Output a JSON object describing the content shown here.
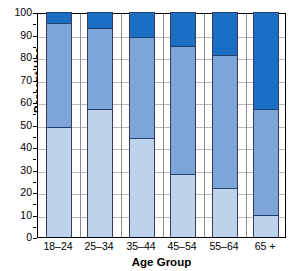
{
  "chart_data": {
    "type": "bar",
    "stacked": true,
    "title": "",
    "xlabel": "Age Group",
    "ylabel": "Percent Use",
    "categories": [
      "18–24",
      "25–34",
      "35–44",
      "45–54",
      "55–64",
      "65 +"
    ],
    "ylim": [
      0,
      100
    ],
    "ytick_labels": [
      "0",
      "10",
      "20",
      "30",
      "40",
      "50",
      "60",
      "70",
      "80",
      "90",
      "100"
    ],
    "ytick_values": [
      0,
      10,
      20,
      30,
      40,
      50,
      60,
      70,
      80,
      90,
      100
    ],
    "grid": true,
    "legend": "none",
    "series": [
      {
        "name": "light-blue-segment",
        "color": "#bdd3ec",
        "values": [
          49,
          57,
          44,
          28,
          22,
          10
        ]
      },
      {
        "name": "medium-blue-segment",
        "color": "#7ea5d8",
        "values": [
          46,
          36,
          45,
          57,
          59,
          47
        ]
      },
      {
        "name": "dark-blue-segment",
        "color": "#1a6fc4",
        "values": [
          5,
          7,
          11,
          15,
          19,
          43
        ]
      }
    ],
    "cumulative_tops": [
      [
        49,
        95,
        100
      ],
      [
        57,
        93,
        100
      ],
      [
        44,
        89,
        100
      ],
      [
        28,
        85,
        100
      ],
      [
        22,
        81,
        100
      ],
      [
        10,
        57,
        100
      ]
    ]
  },
  "axes": {
    "y_title": "Percent Use",
    "x_title": "Age Group"
  }
}
